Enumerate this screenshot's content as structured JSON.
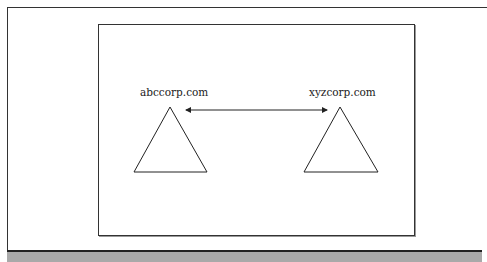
{
  "diagram": {
    "nodes": [
      {
        "id": "left",
        "label": "abccorp.com",
        "shape": "triangle"
      },
      {
        "id": "right",
        "label": "xyzcorp.com",
        "shape": "triangle"
      }
    ],
    "edges": [
      {
        "from": "left",
        "to": "right",
        "type": "bidirectional-arrow"
      }
    ]
  },
  "colors": {
    "stroke": "#222222",
    "bar": "#a9a9a9"
  }
}
